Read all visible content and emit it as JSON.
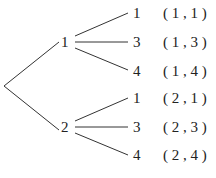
{
  "tree": {
    "root": {
      "label": ""
    },
    "level1": [
      {
        "label": "1",
        "children": [
          {
            "label": "1",
            "pair": "( 1 , 1 )"
          },
          {
            "label": "3",
            "pair": "( 1 , 3 )"
          },
          {
            "label": "4",
            "pair": "( 1 , 4 )"
          }
        ]
      },
      {
        "label": "2",
        "children": [
          {
            "label": "1",
            "pair": "( 2 , 1 )"
          },
          {
            "label": "3",
            "pair": "( 2 , 3 )"
          },
          {
            "label": "4",
            "pair": "( 2 , 4 )"
          }
        ]
      }
    ]
  },
  "colors": {
    "line": "#333333",
    "text": "#222222"
  }
}
